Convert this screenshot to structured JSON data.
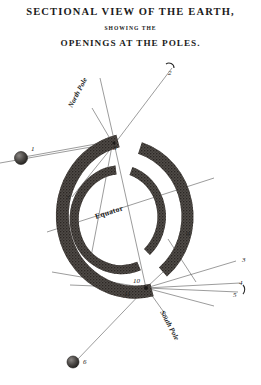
{
  "plate": {
    "title_line1": "SECTIONAL VIEW OF THE EARTH,",
    "title_line2": "SHOWING THE",
    "title_line3": "OPENINGS AT THE POLES."
  },
  "labels": {
    "north_pole": "North Pole",
    "south_pole": "South Pole",
    "equator": "Equator"
  },
  "callouts": [
    {
      "id": "1",
      "text": "1"
    },
    {
      "id": "2",
      "text": "2"
    },
    {
      "id": "3",
      "text": "3"
    },
    {
      "id": "4",
      "text": "4"
    },
    {
      "id": "5",
      "text": "5"
    },
    {
      "id": "6",
      "text": "6"
    },
    {
      "id": "7",
      "text": "7"
    },
    {
      "id": "8",
      "text": "8"
    },
    {
      "id": "9",
      "text": "9"
    },
    {
      "id": "10",
      "text": "10"
    },
    {
      "id": "11",
      "text": "11"
    }
  ],
  "colors": {
    "paper": "#ffffff",
    "ink": "#1b1b1b",
    "shell_fill": "#585450",
    "shell_stroke": "#2e2b28",
    "ray_line": "#4a4a4a",
    "sphere_fill": "#3a3735"
  }
}
